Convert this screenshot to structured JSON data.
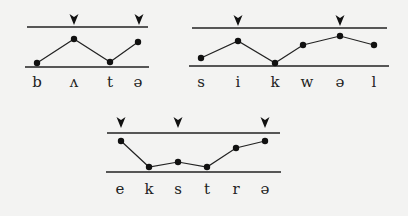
{
  "diagrams": [
    {
      "id": "butter",
      "segments": [
        "b",
        "ʌ",
        "t",
        "ə"
      ],
      "top_line": {
        "x1": 27,
        "x2": 148,
        "y": 27
      },
      "bottom_line": {
        "x1": 25,
        "x2": 149,
        "y": 67
      },
      "points": [
        [
          37,
          63
        ],
        [
          74,
          39
        ],
        [
          110,
          62
        ],
        [
          138,
          42
        ]
      ],
      "stress_markers_x": [
        74,
        139
      ],
      "marker_y": 14,
      "label_y": 87
    },
    {
      "id": "sequel",
      "segments": [
        "s",
        "i",
        "k",
        "w",
        "ə",
        "l"
      ],
      "top_line": {
        "x1": 192,
        "x2": 387,
        "y": 28
      },
      "bottom_line": {
        "x1": 189,
        "x2": 389,
        "y": 66
      },
      "points": [
        [
          201,
          58
        ],
        [
          238,
          41
        ],
        [
          275,
          63
        ],
        [
          303,
          45
        ],
        [
          340,
          36
        ],
        [
          374,
          45
        ]
      ],
      "stress_markers_x": [
        238,
        340
      ],
      "marker_y": 15,
      "label_y": 87
    },
    {
      "id": "extra",
      "segments": [
        "e",
        "k",
        "s",
        "t",
        "r",
        "ə"
      ],
      "top_line": {
        "x1": 107,
        "x2": 280,
        "y": 133
      },
      "bottom_line": {
        "x1": 106,
        "x2": 281,
        "y": 172
      },
      "points": [
        [
          121,
          141
        ],
        [
          149,
          167
        ],
        [
          178,
          162
        ],
        [
          207,
          167
        ],
        [
          236,
          148
        ],
        [
          265,
          141
        ]
      ],
      "stress_markers_x": [
        121,
        178,
        265
      ],
      "marker_y": 117,
      "label_y": 194
    }
  ],
  "labels": {
    "d0": [
      "b",
      "ʌ",
      "t",
      "ə"
    ],
    "d1": [
      "s",
      "i",
      "k",
      "w",
      "ə",
      "l"
    ],
    "d2": [
      "e",
      "k",
      "s",
      "t",
      "r",
      "ə"
    ]
  }
}
